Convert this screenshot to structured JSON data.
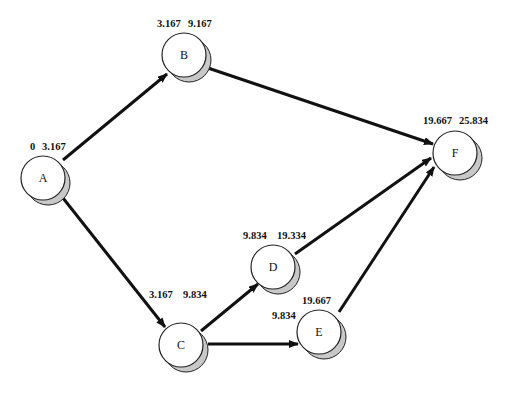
{
  "diagram": {
    "type": "activity-on-node network (critical path)",
    "nodes": [
      {
        "id": "A",
        "label": "A",
        "es": "0",
        "ef": "3.167",
        "cx": 43,
        "cy": 178,
        "es_pos": [
          30,
          150
        ],
        "ef_pos": [
          42,
          150
        ]
      },
      {
        "id": "B",
        "label": "B",
        "es": "3.167",
        "ef": "9.167",
        "cx": 184,
        "cy": 55,
        "es_pos": [
          157,
          27
        ],
        "ef_pos": [
          188,
          27
        ]
      },
      {
        "id": "C",
        "label": "C",
        "es": "3.167",
        "ef": "9.834",
        "cx": 181,
        "cy": 345,
        "es_pos": [
          149,
          298
        ],
        "ef_pos": [
          183,
          298
        ]
      },
      {
        "id": "D",
        "label": "D",
        "es": "9.834",
        "ef": "19.334",
        "cx": 273,
        "cy": 267,
        "es_pos": [
          243,
          239
        ],
        "ef_pos": [
          277,
          239
        ]
      },
      {
        "id": "E",
        "label": "E",
        "es": "9.834",
        "ef": "19.667",
        "cx": 319,
        "cy": 332,
        "es_pos": [
          272,
          319
        ],
        "ef_pos": [
          302,
          304
        ]
      },
      {
        "id": "F",
        "label": "F",
        "es": "19.667",
        "ef": "25.834",
        "cx": 455,
        "cy": 153,
        "es_pos": [
          423,
          124
        ],
        "ef_pos": [
          459,
          124
        ]
      }
    ],
    "edges": [
      {
        "from": "A",
        "to": "B",
        "x1": 63,
        "y1": 160,
        "x2": 167,
        "y2": 74
      },
      {
        "from": "A",
        "to": "C",
        "x1": 63,
        "y1": 198,
        "x2": 165,
        "y2": 327
      },
      {
        "from": "B",
        "to": "F",
        "x1": 208,
        "y1": 68,
        "x2": 433,
        "y2": 144
      },
      {
        "from": "C",
        "to": "D",
        "x1": 201,
        "y1": 331,
        "x2": 258,
        "y2": 284
      },
      {
        "from": "C",
        "to": "E",
        "x1": 208,
        "y1": 344,
        "x2": 298,
        "y2": 344
      },
      {
        "from": "D",
        "to": "F",
        "x1": 295,
        "y1": 254,
        "x2": 431,
        "y2": 158
      },
      {
        "from": "E",
        "to": "F",
        "x1": 339,
        "y1": 312,
        "x2": 434,
        "y2": 167
      }
    ],
    "colors": {
      "node_fill": "#ffffff",
      "node_stroke": "#222222",
      "shadow_fill": "#c8c8c8",
      "edge": "#111111"
    },
    "node_radius": 22,
    "shadow_offset": [
      5,
      5
    ]
  }
}
